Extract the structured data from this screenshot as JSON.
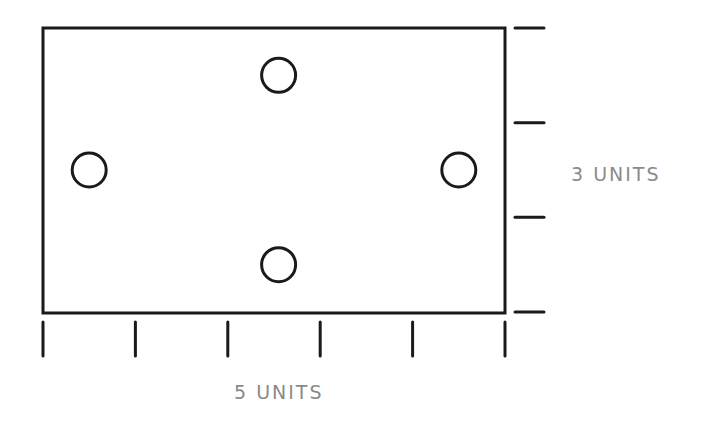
{
  "diagram": {
    "width_label": "5 UNITS",
    "height_label": "3 UNITS",
    "width_units": 5,
    "height_units": 3,
    "holes": [
      {
        "name": "left",
        "x_units": 0.5,
        "y_units": 1.5
      },
      {
        "name": "top",
        "x_units": 2.55,
        "y_units": 0.5
      },
      {
        "name": "bottom",
        "x_units": 2.55,
        "y_units": 2.5
      },
      {
        "name": "right",
        "x_units": 4.5,
        "y_units": 1.5
      }
    ],
    "colors": {
      "stroke": "#1a1a1a",
      "label": "#8a8a8a",
      "background": "#ffffff"
    }
  }
}
